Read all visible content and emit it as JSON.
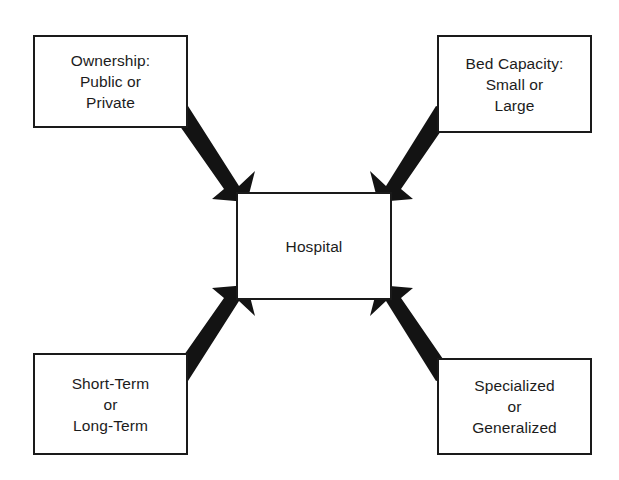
{
  "diagram": {
    "center": {
      "id": "hospital",
      "name": "center-node",
      "lines": [
        "Hospital"
      ]
    },
    "nodes": [
      {
        "id": "ownership",
        "name": "node-ownership",
        "position": "top-left",
        "lines": [
          "Ownership:",
          "Public or",
          "Private"
        ]
      },
      {
        "id": "bed-capacity",
        "name": "node-bed-capacity",
        "position": "top-right",
        "lines": [
          "Bed Capacity:",
          "Small or",
          "Large"
        ]
      },
      {
        "id": "term-length",
        "name": "node-term-length",
        "position": "bottom-left",
        "lines": [
          "Short-Term",
          "or",
          "Long-Term"
        ]
      },
      {
        "id": "scope",
        "name": "node-scope",
        "position": "bottom-right",
        "lines": [
          "Specialized",
          "or",
          "Generalized"
        ]
      }
    ],
    "arrows": [
      {
        "id": "arrow-ownership-to-hospital",
        "from": "ownership",
        "to": "hospital",
        "direction": "down-right"
      },
      {
        "id": "arrow-bed-capacity-to-hospital",
        "from": "bed-capacity",
        "to": "hospital",
        "direction": "down-left"
      },
      {
        "id": "arrow-term-length-to-hospital",
        "from": "term-length",
        "to": "hospital",
        "direction": "up-right"
      },
      {
        "id": "arrow-scope-to-hospital",
        "from": "scope",
        "to": "hospital",
        "direction": "up-left"
      }
    ],
    "colors": {
      "arrow_fill": "#131313",
      "box_border": "#1a1a1a",
      "text": "#1c1c1c",
      "background": "#ffffff"
    }
  }
}
